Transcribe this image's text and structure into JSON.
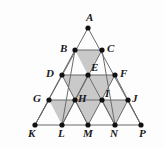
{
  "figure": {
    "shape_type": "geometric-diagram",
    "background_color": "#fdfdfd",
    "line_color": "#6b6b6b",
    "shaded_fill_color": "#c9c9c9",
    "unshaded_fill_color": "#ffffff",
    "point_color": "#111111",
    "point_radius": 2.6,
    "rows": 4,
    "side_divisions": 4
  },
  "points": [
    {
      "id": "A",
      "label": "A",
      "x": 88,
      "y": 28,
      "label_x": 86,
      "label_y": 12,
      "label_anchor": "above"
    },
    {
      "id": "B",
      "label": "B",
      "x": 75,
      "y": 50,
      "label_x": 60,
      "label_y": 43,
      "label_anchor": "left"
    },
    {
      "id": "C",
      "label": "C",
      "x": 102,
      "y": 50,
      "label_x": 107,
      "label_y": 43,
      "label_anchor": "right"
    },
    {
      "id": "D",
      "label": "D",
      "x": 62,
      "y": 75,
      "label_x": 46,
      "label_y": 68,
      "label_anchor": "left"
    },
    {
      "id": "E",
      "label": "E",
      "x": 88,
      "y": 75,
      "label_x": 91,
      "label_y": 62,
      "label_anchor": "above-right"
    },
    {
      "id": "F",
      "label": "F",
      "x": 115,
      "y": 75,
      "label_x": 120,
      "label_y": 68,
      "label_anchor": "right"
    },
    {
      "id": "G",
      "label": "G",
      "x": 49,
      "y": 100,
      "label_x": 33,
      "label_y": 93,
      "label_anchor": "left"
    },
    {
      "id": "H",
      "label": "H",
      "x": 75,
      "y": 100,
      "label_x": 78,
      "label_y": 93,
      "label_anchor": "right"
    },
    {
      "id": "I",
      "label": "I",
      "x": 102,
      "y": 100,
      "label_x": 105,
      "label_y": 88,
      "label_anchor": "above-right"
    },
    {
      "id": "J",
      "label": "J",
      "x": 128,
      "y": 100,
      "label_x": 132,
      "label_y": 93,
      "label_anchor": "right"
    },
    {
      "id": "K",
      "label": "K",
      "x": 35,
      "y": 125,
      "label_x": 28,
      "label_y": 128,
      "label_anchor": "below-left"
    },
    {
      "id": "L",
      "label": "L",
      "x": 62,
      "y": 125,
      "label_x": 58,
      "label_y": 128,
      "label_anchor": "below"
    },
    {
      "id": "M",
      "label": "M",
      "x": 88,
      "y": 125,
      "label_x": 83,
      "label_y": 128,
      "label_anchor": "below"
    },
    {
      "id": "N",
      "label": "N",
      "x": 115,
      "y": 125,
      "label_x": 110,
      "label_y": 128,
      "label_anchor": "below"
    },
    {
      "id": "P",
      "label": "P",
      "x": 141,
      "y": 125,
      "label_x": 139,
      "label_y": 128,
      "label_anchor": "below-right"
    }
  ],
  "shaded_regions": [
    {
      "name": "triangle-BCE",
      "vertices": [
        "B",
        "C",
        "E"
      ],
      "orientation": "down"
    },
    {
      "name": "triangle-DEH",
      "vertices": [
        "D",
        "E",
        "H"
      ],
      "orientation": "down"
    },
    {
      "name": "triangle-EFI",
      "vertices": [
        "E",
        "F",
        "I"
      ],
      "orientation": "down"
    },
    {
      "name": "triangle-EHI",
      "vertices": [
        "E",
        "H",
        "I"
      ],
      "orientation": "up"
    },
    {
      "name": "triangle-HIM",
      "vertices": [
        "H",
        "I",
        "M"
      ],
      "orientation": "down"
    },
    {
      "name": "triangle-GHL",
      "vertices": [
        "G",
        "H",
        "L"
      ],
      "orientation": "down"
    },
    {
      "name": "triangle-IJN",
      "vertices": [
        "I",
        "J",
        "N"
      ],
      "orientation": "down"
    }
  ],
  "unshaded_regions": [
    {
      "name": "triangle-ABC",
      "vertices": [
        "A",
        "B",
        "C"
      ],
      "orientation": "up"
    },
    {
      "name": "triangle-BDE",
      "vertices": [
        "B",
        "D",
        "E"
      ],
      "orientation": "up"
    },
    {
      "name": "triangle-CEF",
      "vertices": [
        "C",
        "E",
        "F"
      ],
      "orientation": "up"
    },
    {
      "name": "triangle-DGH",
      "vertices": [
        "D",
        "G",
        "H"
      ],
      "orientation": "up"
    },
    {
      "name": "triangle-FIJ",
      "vertices": [
        "F",
        "I",
        "J"
      ],
      "orientation": "up"
    },
    {
      "name": "triangle-GKL",
      "vertices": [
        "G",
        "K",
        "L"
      ],
      "orientation": "up"
    },
    {
      "name": "triangle-HLM",
      "vertices": [
        "H",
        "L",
        "M"
      ],
      "orientation": "up"
    },
    {
      "name": "triangle-IMN",
      "vertices": [
        "I",
        "M",
        "N"
      ],
      "orientation": "up"
    },
    {
      "name": "triangle-JNP",
      "vertices": [
        "J",
        "N",
        "P"
      ],
      "orientation": "up"
    }
  ],
  "segments": [
    {
      "name": "edge-A-K",
      "from": "A",
      "to": "K"
    },
    {
      "name": "edge-A-P",
      "from": "A",
      "to": "P"
    },
    {
      "name": "edge-K-P",
      "from": "K",
      "to": "P"
    },
    {
      "name": "row-B-C",
      "from": "B",
      "to": "C"
    },
    {
      "name": "row-D-F",
      "from": "D",
      "to": "F"
    },
    {
      "name": "row-G-J",
      "from": "G",
      "to": "J"
    },
    {
      "name": "left-diag-B-L",
      "from": "B",
      "to": "L"
    },
    {
      "name": "left-diag-C-N",
      "from": "C",
      "to": "N"
    },
    {
      "name": "left-diag-D-M",
      "from": "D",
      "to": "M"
    },
    {
      "name": "left-diag-E-N",
      "from": "E",
      "to": "N"
    },
    {
      "name": "left-diag-F-P",
      "from": "F",
      "to": "P"
    },
    {
      "name": "right-diag-C-L",
      "from": "C",
      "to": "L"
    },
    {
      "name": "right-diag-B-K",
      "from": "B",
      "to": "K"
    },
    {
      "name": "right-diag-F-M",
      "from": "F",
      "to": "M"
    },
    {
      "name": "right-diag-E-L",
      "from": "E",
      "to": "L"
    },
    {
      "name": "right-diag-J-N",
      "from": "J",
      "to": "N"
    },
    {
      "name": "right-diag-G-K",
      "from": "G",
      "to": "K"
    },
    {
      "name": "right-diag-H-M",
      "from": "H",
      "to": "M"
    },
    {
      "name": "right-diag-I-N",
      "from": "I",
      "to": "N"
    },
    {
      "name": "right-diag-J-P",
      "from": "J",
      "to": "P"
    }
  ]
}
